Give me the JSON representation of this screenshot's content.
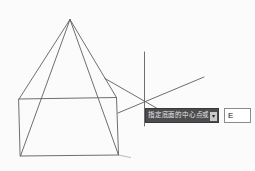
{
  "dynamic_input": {
    "prompt": "指定底面的中心点或",
    "value": "E",
    "options_icon": "down-arrow-icon"
  },
  "colors": {
    "background": "#fbfbfb",
    "line_stroke": "#5f5f5f",
    "tooltip_bg": "#4c4c4e",
    "tooltip_border": "#39393b",
    "tooltip_text": "#e6e6e6",
    "option_icon_bg": "#c9c9c9",
    "option_icon_glyph": "#242424",
    "input_bg": "#ffffff",
    "input_border": "#8b8b8b",
    "input_text": "#141414"
  }
}
